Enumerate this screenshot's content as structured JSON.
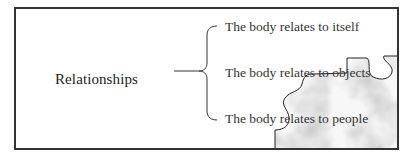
{
  "diagram": {
    "root": "Relationships",
    "branches": [
      {
        "label": "The body relates to itself"
      },
      {
        "label": "The body relates to objects"
      },
      {
        "label": "The body relates to people"
      }
    ]
  },
  "colors": {
    "frame": "#333333",
    "text": "#333333",
    "puzzle_outline": "#222222"
  }
}
